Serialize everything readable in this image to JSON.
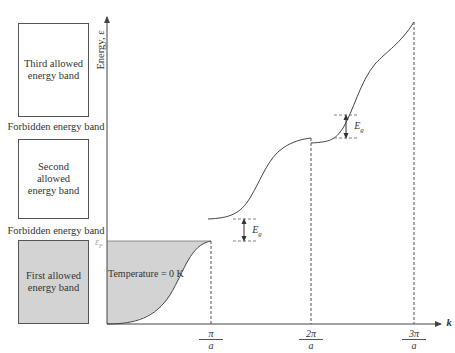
{
  "bands": {
    "third": "Third allowed energy band",
    "forbidden_upper": "Forbidden energy band",
    "second": "Second allowed energy band",
    "forbidden_lower": "Forbidden energy band",
    "first": "First allowed energy band"
  },
  "axes": {
    "y_label": "Energy, ε",
    "x_label": "k",
    "fermi_label": "εF",
    "ticks": [
      {
        "num": "π",
        "den": "a"
      },
      {
        "num": "2π",
        "den": "a"
      },
      {
        "num": "3π",
        "den": "a"
      }
    ]
  },
  "annotations": {
    "temperature": "Temperature = 0 K",
    "gap_label": "Eg"
  },
  "colors": {
    "filled_band": "#d3d3d3",
    "line": "#444444",
    "fermi_text": "#aaaaaa"
  }
}
